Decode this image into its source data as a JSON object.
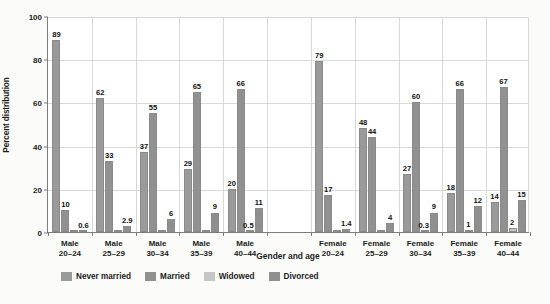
{
  "chart_data": {
    "type": "bar",
    "title": "",
    "xlabel": "Gender and age",
    "ylabel": "Percent distribution",
    "ylim": [
      0,
      100
    ],
    "yticks": [
      0,
      20,
      40,
      60,
      80,
      100
    ],
    "grid": true,
    "legend_position": "bottom",
    "categories": [
      "Male 20–24",
      "Male 25–29",
      "Male 30–34",
      "Male 35–39",
      "Male 40–44",
      "",
      "Female 20–24",
      "Female 25–29",
      "Female 30–34",
      "Female 35–39",
      "Female 40–44"
    ],
    "category_lines": [
      [
        "Male",
        "20–24"
      ],
      [
        "Male",
        "25–29"
      ],
      [
        "Male",
        "30–34"
      ],
      [
        "Male",
        "35–39"
      ],
      [
        "Male",
        "40–44"
      ],
      [
        "",
        ""
      ],
      [
        "Female",
        "20–24"
      ],
      [
        "Female",
        "25–29"
      ],
      [
        "Female",
        "30–34"
      ],
      [
        "Female",
        "35–39"
      ],
      [
        "Female",
        "40–44"
      ]
    ],
    "series": [
      {
        "name": "Never married",
        "color": "#9a9a9a",
        "values": [
          89,
          62,
          37,
          29,
          20,
          null,
          79,
          48,
          27,
          18,
          14
        ],
        "labels": [
          "89",
          "62",
          "37",
          "29",
          "20",
          "",
          "79",
          "48",
          "27",
          "18",
          "14"
        ]
      },
      {
        "name": "Married",
        "color": "#919191",
        "values": [
          10,
          33,
          55,
          65,
          66,
          null,
          17,
          44,
          60,
          66,
          67
        ],
        "labels": [
          "10",
          "33",
          "55",
          "65",
          "66",
          "",
          "17",
          "44",
          "60",
          "66",
          "67"
        ]
      },
      {
        "name": "Widowed",
        "color": "#c6c6c6",
        "values": [
          0.1,
          0.1,
          0.1,
          0.1,
          0.5,
          null,
          0.1,
          0.1,
          0.3,
          1,
          2
        ],
        "labels": [
          "",
          "",
          "",
          "",
          "0.5",
          "",
          "",
          "",
          "0.3",
          "1",
          "2"
        ]
      },
      {
        "name": "Divorced",
        "color": "#8f8f8f",
        "values": [
          0.6,
          2.9,
          6,
          9,
          11,
          null,
          1.4,
          4,
          9,
          12,
          15
        ],
        "labels": [
          "0.6",
          "2.9",
          "6",
          "9",
          "11",
          "",
          "1.4",
          "4",
          "9",
          "12",
          "15"
        ]
      }
    ]
  }
}
